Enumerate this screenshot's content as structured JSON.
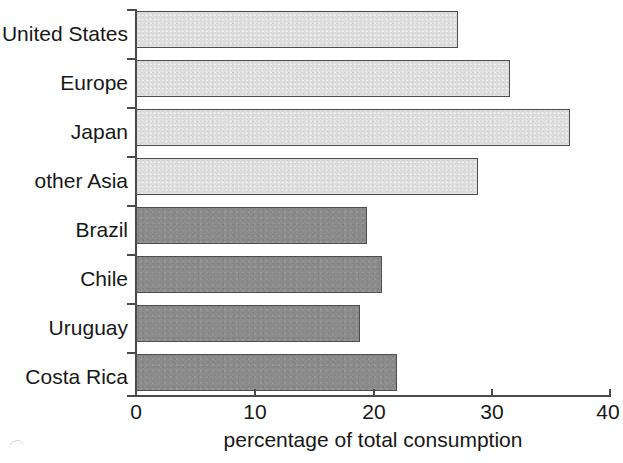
{
  "chart_data": {
    "type": "bar",
    "orientation": "horizontal",
    "title": "",
    "xlabel": "percentage of total consumption",
    "ylabel": "",
    "xlim": [
      0,
      40
    ],
    "xticks": [
      0,
      10,
      20,
      30,
      40
    ],
    "xtick_labels": [
      "0",
      "10",
      "20",
      "30",
      "40"
    ],
    "grid": false,
    "legend": null,
    "categories": [
      "United States",
      "Europe",
      "Japan",
      "other Asia",
      "Brazil",
      "Chile",
      "Uruguay",
      "Costa Rica"
    ],
    "values": [
      27.2,
      31.6,
      36.6,
      28.9,
      19.5,
      20.8,
      18.9,
      22.0
    ],
    "bar_styles": [
      "light",
      "light",
      "light",
      "light",
      "dark",
      "dark",
      "dark",
      "dark"
    ],
    "colors": {
      "light_bar": "#dcdcdc",
      "dark_bar": "#8c8c8c",
      "bar_outline": "#4d4d4d",
      "axis": "#4a4a4a",
      "text": "#171717",
      "background": "#ffffff"
    }
  }
}
